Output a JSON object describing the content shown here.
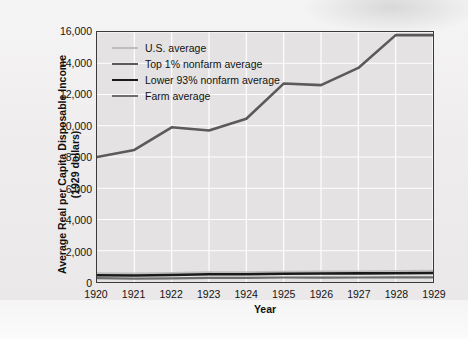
{
  "chart_data": {
    "type": "line",
    "title": "",
    "xlabel": "Year",
    "ylabel": "Average Real per Capita Disposable Income (1929 dollars)",
    "ylabel_line1": "Average Real per Capita Disposable Income",
    "ylabel_line2": "(1929 dollars)",
    "x": [
      1920,
      1921,
      1922,
      1923,
      1924,
      1925,
      1926,
      1927,
      1928,
      1929
    ],
    "categories": [
      "1920",
      "1921",
      "1922",
      "1923",
      "1924",
      "1925",
      "1926",
      "1927",
      "1928",
      "1929"
    ],
    "xlim": [
      1920,
      1929
    ],
    "ylim": [
      0,
      16000
    ],
    "yticks": [
      0,
      2000,
      4000,
      6000,
      8000,
      10000,
      12000,
      14000,
      16000
    ],
    "ytick_labels": [
      "0",
      "2,000",
      "4,000",
      "6,000",
      "8,000",
      "10,000",
      "12,000",
      "14,000",
      "16,000"
    ],
    "grid": true,
    "grid_color": "#ffffff",
    "plot_background": "#e4e2e2",
    "legend_position": "upper left",
    "series": [
      {
        "name": "U.S. average",
        "color": "#bdbdbd",
        "width": 2.0,
        "values": [
          560,
          545,
          575,
          620,
          625,
          655,
          675,
          680,
          700,
          715
        ]
      },
      {
        "name": "Top 1% nonfarm average",
        "color": "#5a5a5a",
        "width": 2.6,
        "values": [
          8000,
          8450,
          9900,
          9700,
          10450,
          12700,
          12600,
          13700,
          15800,
          15800
        ]
      },
      {
        "name": "Lower 93% nonfarm average",
        "color": "#1a1a1a",
        "width": 2.6,
        "values": [
          430,
          420,
          450,
          495,
          500,
          530,
          545,
          550,
          565,
          580
        ]
      },
      {
        "name": "Farm average",
        "color": "#6e6e6e",
        "width": 2.2,
        "values": [
          250,
          215,
          235,
          265,
          270,
          290,
          285,
          290,
          295,
          300
        ]
      }
    ]
  }
}
